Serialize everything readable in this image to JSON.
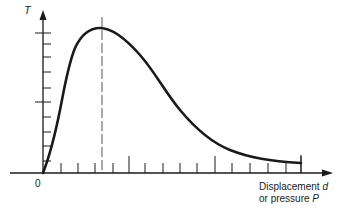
{
  "chart_data": {
    "type": "line",
    "title": "",
    "ylabel": "T",
    "xlabel_line1": "Displacement",
    "xlabel_var1": "d",
    "xlabel_line2": "or pressure",
    "xlabel_var2": "P",
    "origin_label": "0",
    "grid": false,
    "legend": null,
    "axis_ranges": {
      "x": [
        0,
        1
      ],
      "y": [
        0,
        1
      ]
    },
    "annotations": [
      {
        "type": "dashed-vertical-line",
        "x": 0.2,
        "description": "position of curve maximum"
      }
    ],
    "series": [
      {
        "name": "T vs displacement/pressure",
        "x": [
          0.0,
          0.04,
          0.07,
          0.09,
          0.11,
          0.15,
          0.2,
          0.25,
          0.33,
          0.37,
          0.44,
          0.5,
          0.57,
          0.64,
          0.7,
          0.76,
          0.83,
          0.9,
          0.98
        ],
        "y": [
          0.0,
          0.21,
          0.46,
          0.67,
          0.81,
          0.9,
          0.93,
          0.9,
          0.76,
          0.7,
          0.51,
          0.35,
          0.21,
          0.11,
          0.05,
          0.02,
          0.0,
          -0.02,
          -0.04
        ]
      }
    ],
    "x_ticks_count": 15,
    "y_ticks_count": 10,
    "ticks_labeled": false
  },
  "geometry": {
    "origin": [
      43,
      173
    ],
    "x_axis_end": 332,
    "y_axis_top": 12,
    "x_ticks": [
      61,
      78,
      95,
      113,
      129,
      145,
      163,
      180,
      197,
      215,
      232,
      250,
      268,
      286,
      301
    ],
    "x_ticks_tall": [
      129,
      215,
      301
    ],
    "y_ticks": [
      33,
      44,
      57,
      72,
      88,
      102,
      117,
      132,
      146,
      161
    ],
    "y_ticks_long": [
      33,
      102
    ],
    "dashed_x": 102,
    "dashed_top": 17,
    "curve_path": "M43,173 C50,155 55,135 60,110 C64,90 68,65 75,48 C82,33 90,28 100,28 C112,28 125,38 140,55 C155,72 165,92 180,110 C195,128 210,142 230,150 C250,158 270,161 301,163"
  },
  "colors": {
    "ink": "#1a1a1a",
    "dashed": "#555555",
    "background": "#ffffff"
  }
}
